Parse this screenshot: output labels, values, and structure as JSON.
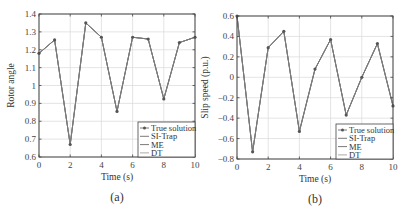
{
  "chart_data": [
    {
      "type": "line",
      "panel": "(a)",
      "title": "",
      "xlabel": "Time (s)",
      "ylabel": "Rotor angle",
      "xlim": [
        0,
        10
      ],
      "ylim": [
        0.6,
        1.4
      ],
      "xticks": [
        "0",
        "2",
        "4",
        "6",
        "8",
        "10"
      ],
      "yticks": [
        "0.6",
        "0.7",
        "0.8",
        "0.9",
        "1",
        "1.1",
        "1.2",
        "1.3",
        "1.4"
      ],
      "grid": true,
      "legend_position": "lower right",
      "x": [
        0,
        1,
        2,
        3,
        4,
        5,
        6,
        7,
        8,
        9,
        10
      ],
      "series": [
        {
          "name": "True solution",
          "marker": "*",
          "values": [
            1.18,
            1.255,
            0.67,
            1.35,
            1.27,
            0.855,
            1.27,
            1.26,
            0.925,
            1.24,
            1.27
          ]
        },
        {
          "name": "SI-Trap",
          "values": [
            1.18,
            1.255,
            0.67,
            1.35,
            1.27,
            0.855,
            1.27,
            1.26,
            0.925,
            1.24,
            1.27
          ]
        },
        {
          "name": "ME",
          "values": [
            1.18,
            1.255,
            0.67,
            1.35,
            1.27,
            0.855,
            1.27,
            1.26,
            0.925,
            1.24,
            1.27
          ]
        },
        {
          "name": "DT",
          "values": [
            1.18,
            1.255,
            0.67,
            1.35,
            1.27,
            0.855,
            1.27,
            1.26,
            0.925,
            1.24,
            1.27
          ]
        }
      ]
    },
    {
      "type": "line",
      "panel": "(b)",
      "title": "",
      "xlabel": "Time (s)",
      "ylabel": "Slip speed (p.u.)",
      "xlim": [
        0,
        10
      ],
      "ylim": [
        -0.8,
        0.6
      ],
      "xticks": [
        "0",
        "2",
        "4",
        "6",
        "8",
        "10"
      ],
      "yticks": [
        "-0.8",
        "-0.6",
        "-0.4",
        "-0.2",
        "0",
        "0.2",
        "0.4",
        "0.6"
      ],
      "grid": true,
      "legend_position": "lower right",
      "x": [
        0,
        1,
        2,
        3,
        4,
        5,
        6,
        7,
        8,
        9,
        10
      ],
      "series": [
        {
          "name": "True solution",
          "marker": "*",
          "values": [
            0.6,
            -0.73,
            0.29,
            0.45,
            -0.53,
            0.08,
            0.37,
            -0.37,
            0.0,
            0.33,
            -0.28
          ]
        },
        {
          "name": "SI-Trap",
          "values": [
            0.6,
            -0.73,
            0.29,
            0.45,
            -0.53,
            0.08,
            0.37,
            -0.37,
            0.0,
            0.33,
            -0.28
          ]
        },
        {
          "name": "ME",
          "values": [
            0.6,
            -0.73,
            0.29,
            0.45,
            -0.53,
            0.08,
            0.37,
            -0.37,
            0.0,
            0.33,
            -0.28
          ]
        },
        {
          "name": "DT",
          "values": [
            0.6,
            -0.73,
            0.29,
            0.45,
            -0.53,
            0.08,
            0.37,
            -0.37,
            0.0,
            0.33,
            -0.28
          ]
        }
      ]
    }
  ],
  "captions": {
    "a": "(a)",
    "b": "(b)"
  },
  "colors": {
    "line": "#7a7a7a",
    "marker": "#555555",
    "axis": "#444444",
    "grid": "#d8d8d8"
  }
}
